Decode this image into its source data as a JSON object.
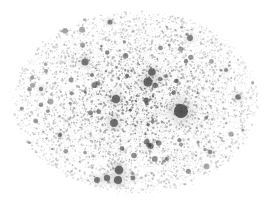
{
  "visualization": {
    "type": "network-graph",
    "title": "",
    "description": "Large-scale force-directed network graph rendered as a dense grayscale hairball",
    "background_color": "#ffffff",
    "node_color": "#4a4a4a",
    "edge_color": "#9a9a9a",
    "hub_color": "#3a3a3a",
    "canvas": {
      "width": 272,
      "height": 204
    },
    "layout": {
      "shape": "ellipse",
      "center_x": 136,
      "center_y": 102,
      "radius_x": 122,
      "radius_y": 91,
      "bounds": {
        "left": 14,
        "top": 11,
        "right": 258,
        "bottom": 193
      }
    },
    "counts": {
      "approx_nodes": 6400,
      "approx_edges": 2600,
      "labeled_hubs": 22
    },
    "hubs": [
      {
        "id": "hub-primary",
        "x": 181,
        "y": 111,
        "r": 7.0,
        "opacity": 0.8,
        "spokes": 26,
        "spoke_len": 46
      },
      {
        "id": "hub-b",
        "x": 148,
        "y": 82,
        "r": 4.6,
        "opacity": 0.72,
        "spokes": 12,
        "spoke_len": 26
      },
      {
        "id": "hub-c",
        "x": 152,
        "y": 72,
        "r": 3.8,
        "opacity": 0.7,
        "spokes": 10,
        "spoke_len": 22
      },
      {
        "id": "hub-d",
        "x": 116,
        "y": 99,
        "r": 4.2,
        "opacity": 0.68,
        "spokes": 14,
        "spoke_len": 30
      },
      {
        "id": "hub-e",
        "x": 114,
        "y": 123,
        "r": 4.0,
        "opacity": 0.66,
        "spokes": 12,
        "spoke_len": 26
      },
      {
        "id": "hub-f",
        "x": 85,
        "y": 62,
        "r": 3.6,
        "opacity": 0.64,
        "spokes": 10,
        "spoke_len": 24
      },
      {
        "id": "hub-g",
        "x": 190,
        "y": 38,
        "r": 3.0,
        "opacity": 0.58,
        "spokes": 8,
        "spoke_len": 20
      },
      {
        "id": "hub-h",
        "x": 238,
        "y": 97,
        "r": 2.8,
        "opacity": 0.56,
        "spokes": 8,
        "spoke_len": 18
      },
      {
        "id": "hub-i",
        "x": 119,
        "y": 170,
        "r": 4.4,
        "opacity": 0.72,
        "spokes": 9,
        "spoke_len": 20
      },
      {
        "id": "hub-j",
        "x": 118,
        "y": 180,
        "r": 4.0,
        "opacity": 0.7,
        "spokes": 8,
        "spoke_len": 18
      },
      {
        "id": "hub-k",
        "x": 107,
        "y": 178,
        "r": 3.2,
        "opacity": 0.66,
        "spokes": 7,
        "spoke_len": 16
      },
      {
        "id": "hub-l",
        "x": 97,
        "y": 180,
        "r": 3.0,
        "opacity": 0.62,
        "spokes": 6,
        "spoke_len": 15
      },
      {
        "id": "hub-m",
        "x": 133,
        "y": 178,
        "r": 2.4,
        "opacity": 0.56,
        "spokes": 6,
        "spoke_len": 14
      },
      {
        "id": "hub-n",
        "x": 149,
        "y": 145,
        "r": 2.6,
        "opacity": 0.58,
        "spokes": 7,
        "spoke_len": 16
      },
      {
        "id": "hub-o",
        "x": 160,
        "y": 79,
        "r": 2.2,
        "opacity": 0.54,
        "spokes": 5,
        "spoke_len": 13
      },
      {
        "id": "hub-p",
        "x": 166,
        "y": 76,
        "r": 1.9,
        "opacity": 0.52,
        "spokes": 5,
        "spoke_len": 12
      },
      {
        "id": "hub-q",
        "x": 110,
        "y": 22,
        "r": 2.6,
        "opacity": 0.56,
        "spokes": 6,
        "spoke_len": 16
      },
      {
        "id": "hub-r",
        "x": 41,
        "y": 89,
        "r": 2.2,
        "opacity": 0.52,
        "spokes": 6,
        "spoke_len": 15
      },
      {
        "id": "hub-s",
        "x": 60,
        "y": 135,
        "r": 2.2,
        "opacity": 0.52,
        "spokes": 6,
        "spoke_len": 15
      },
      {
        "id": "hub-t",
        "x": 210,
        "y": 152,
        "r": 2.2,
        "opacity": 0.52,
        "spokes": 6,
        "spoke_len": 15
      },
      {
        "id": "hub-u",
        "x": 226,
        "y": 70,
        "r": 2.0,
        "opacity": 0.5,
        "spokes": 5,
        "spoke_len": 14
      },
      {
        "id": "hub-v",
        "x": 167,
        "y": 159,
        "r": 2.0,
        "opacity": 0.5,
        "spokes": 5,
        "spoke_len": 14
      }
    ],
    "density": {
      "core_weight": 1.0,
      "rim_falloff": 0.55,
      "node_min_radius": 0.28,
      "node_max_radius": 1.5
    }
  }
}
